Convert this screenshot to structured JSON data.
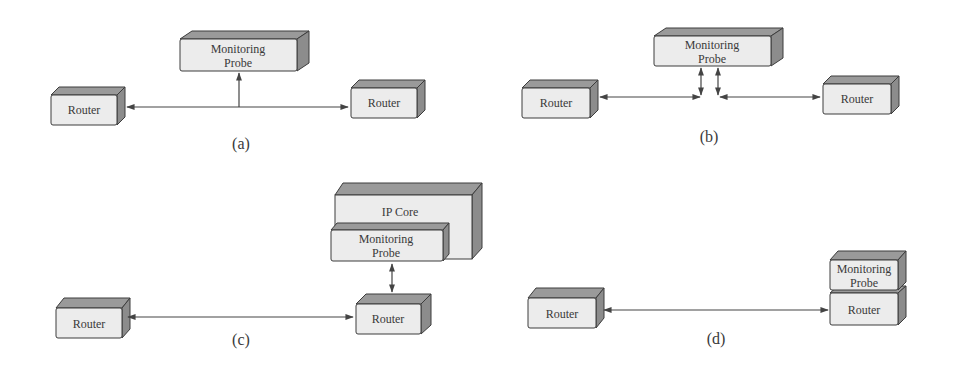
{
  "colors": {
    "front": "#ececec",
    "top": "#9a9a9a",
    "side": "#8c8c8c",
    "stroke": "#3c3c3c",
    "line": "#444444",
    "text": "#3a3a3a"
  },
  "panels": [
    {
      "id": "a",
      "caption": "(a)",
      "router_left": "Router",
      "router_right": "Router",
      "probe_line1": "Monitoring",
      "probe_line2": "Probe",
      "description": "Probe tapped onto link between two routers (unidirectional tap)"
    },
    {
      "id": "b",
      "caption": "(b)",
      "router_left": "Router",
      "router_right": "Router",
      "probe_line1": "Monitoring",
      "probe_line2": "Probe",
      "description": "Probe inserted inline on the link between two routers"
    },
    {
      "id": "c",
      "caption": "(c)",
      "router_left": "Router",
      "router_right": "Router",
      "ip_core": "IP Core",
      "probe_line1": "Monitoring",
      "probe_line2": "Probe",
      "description": "Probe attached to IP core, connected to router"
    },
    {
      "id": "d",
      "caption": "(d)",
      "router_left": "Router",
      "router_right": "Router",
      "probe_line1": "Monitoring",
      "probe_line2": "Probe",
      "description": "Probe integrated on top of router"
    }
  ]
}
